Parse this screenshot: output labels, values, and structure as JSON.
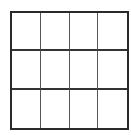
{
  "grid": {
    "rows": 3,
    "columns": 4,
    "border_color": "#2a2a2a",
    "line_color": "#555555",
    "cell_color": "#ffffff"
  }
}
